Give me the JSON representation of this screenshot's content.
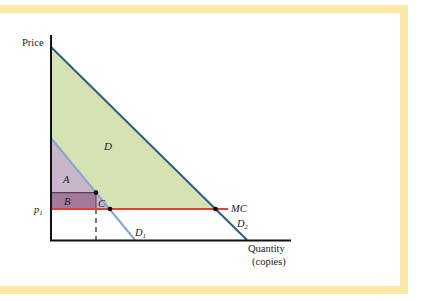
{
  "figure": {
    "type": "economics-diagram",
    "axes": {
      "y_label": "Price",
      "x_label_line1": "Quantity",
      "x_label_line2": "(copies)"
    },
    "price_label": {
      "base": "p",
      "sub": "1"
    },
    "curves": {
      "mc": {
        "label": "MC",
        "color": "#e0442e"
      },
      "d1": {
        "base": "D",
        "sub": "1",
        "color": "#86a7cf"
      },
      "d2": {
        "base": "D",
        "sub": "2",
        "color": "#2d5b8c"
      }
    },
    "regions": {
      "a": {
        "label": "A",
        "color": "#c8b7cb"
      },
      "b": {
        "label": "B",
        "color": "#a47a9b"
      },
      "c": {
        "label": "C",
        "color": "#c8b7cb"
      },
      "d": {
        "label": "D",
        "color": "#d5e3b3"
      }
    },
    "frame_color": "#fbe9a5"
  }
}
